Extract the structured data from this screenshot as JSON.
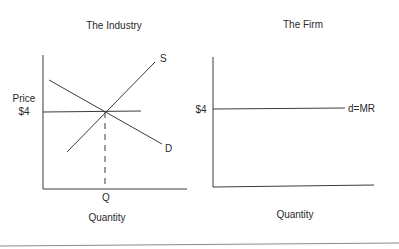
{
  "industry": {
    "title": "The Industry",
    "y_label_line1": "Price",
    "y_label_line2": "$4",
    "x_tick": "Q",
    "x_label": "Quantity",
    "supply_label": "S",
    "demand_label": "D"
  },
  "firm": {
    "title": "The Firm",
    "price_label": "$4",
    "curve_label": "d=MR",
    "x_label": "Quantity"
  },
  "colors": {
    "line": "#3a3a3a",
    "text": "#2a2a2a",
    "rule": "#8a8a8a"
  }
}
